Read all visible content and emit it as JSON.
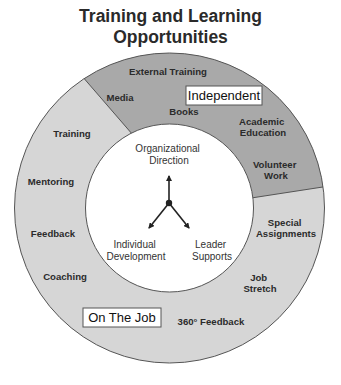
{
  "title": {
    "line1": "Training and Learning",
    "line2": "Opportunities"
  },
  "colors": {
    "independent_fill": "#a9a9a9",
    "on_the_job_fill": "#d6d6d6",
    "outline": "#555555",
    "inner_fill": "#ffffff",
    "text": "#2b2b2b"
  },
  "segments": {
    "independent": {
      "label": "Independent",
      "items": [
        {
          "id": "external-training",
          "lines": [
            "External Training"
          ]
        },
        {
          "id": "media",
          "lines": [
            "Media"
          ]
        },
        {
          "id": "books",
          "lines": [
            "Books"
          ]
        },
        {
          "id": "academic-education",
          "lines": [
            "Academic",
            "Education"
          ]
        },
        {
          "id": "volunteer-work",
          "lines": [
            "Volunteer",
            "Work"
          ]
        }
      ]
    },
    "on_the_job": {
      "label": "On The Job",
      "items": [
        {
          "id": "training",
          "lines": [
            "Training"
          ]
        },
        {
          "id": "mentoring",
          "lines": [
            "Mentoring"
          ]
        },
        {
          "id": "feedback",
          "lines": [
            "Feedback"
          ]
        },
        {
          "id": "coaching",
          "lines": [
            "Coaching"
          ]
        },
        {
          "id": "special-assignments",
          "lines": [
            "Special",
            "Assignments"
          ]
        },
        {
          "id": "job-stretch",
          "lines": [
            "Job",
            "Stretch"
          ]
        },
        {
          "id": "360-feedback",
          "lines": [
            "360° Feedback"
          ]
        }
      ]
    }
  },
  "center": {
    "top": [
      "Organizational",
      "Direction"
    ],
    "left": [
      "Individual",
      "Development"
    ],
    "right": [
      "Leader",
      "Supports"
    ]
  }
}
